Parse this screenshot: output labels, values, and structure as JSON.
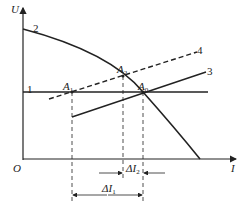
{
  "diagram": {
    "axes": {
      "y_label": "U",
      "x_label": "I",
      "origin_label": "O"
    },
    "curves": [
      {
        "id": "1",
        "label": "1",
        "style": "solid",
        "description": "horizontal line"
      },
      {
        "id": "2",
        "label": "2",
        "style": "solid",
        "description": "falling curve"
      },
      {
        "id": "3",
        "label": "3",
        "style": "solid",
        "description": "rising line"
      },
      {
        "id": "4",
        "label": "4",
        "style": "dashed",
        "description": "rising dashed line"
      }
    ],
    "points": [
      {
        "label": "A",
        "sub": "1"
      },
      {
        "label": "A",
        "sub": "2"
      },
      {
        "label": "A",
        "sub": "0"
      }
    ],
    "dimensions": [
      {
        "label": "ΔI",
        "sub": "2"
      },
      {
        "label": "ΔI",
        "sub": "1"
      }
    ],
    "colors": {
      "line": "#222222",
      "background": "#ffffff"
    }
  }
}
